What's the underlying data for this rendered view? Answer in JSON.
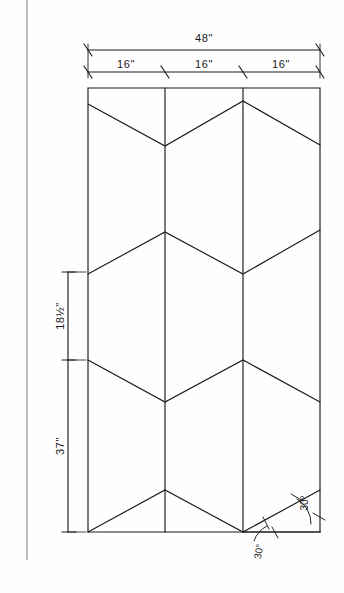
{
  "drawing": {
    "title": "Chevron panel layout drawing",
    "background_color": "#fefefe",
    "ink_color": "#1a1a1a",
    "dimensions": {
      "overall_width": "48\"",
      "segment_1": "16\"",
      "segment_2": "16\"",
      "segment_3": "16\"",
      "upper_height": "18½\"",
      "lower_height": "37\""
    },
    "angles": {
      "lower_left": "30°",
      "lower_right": "30°"
    },
    "geometry": {
      "panel_left": 88,
      "panel_right": 320,
      "panel_top": 88,
      "panel_bottom": 532,
      "columns": [
        88,
        165,
        243,
        320
      ],
      "zigzag_rows": [
        {
          "edge_y": 104,
          "mid_y": 146,
          "peak_y": 101,
          "phase": "down"
        },
        {
          "edge_y": 274,
          "mid_y": 232,
          "peak_y": 230,
          "phase": "up"
        },
        {
          "edge_y": 360,
          "mid_y": 402,
          "peak_y": 360,
          "phase": "down"
        },
        {
          "edge_y": 532,
          "mid_y": 490,
          "peak_y": 490,
          "phase": "up"
        }
      ]
    }
  }
}
